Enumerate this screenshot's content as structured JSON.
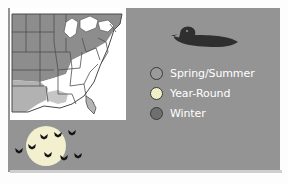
{
  "figure": {
    "type": "range-map-infographic",
    "background_color": "#949494",
    "panel_border_color": "#ffffff"
  },
  "map": {
    "name": "eastern-united-states-range-map",
    "background_color": "#ffffff",
    "state_outline_color": "#4a4a4a",
    "regions": [
      {
        "name": "spring-summer-range",
        "fill": "#8f8f8f"
      },
      {
        "name": "year-round-range",
        "fill": "#ffffff"
      },
      {
        "name": "winter-range",
        "fill": "#b9b9b9"
      }
    ]
  },
  "bird": {
    "name": "duck-silhouette",
    "color": "#2f2f2f"
  },
  "legend": {
    "title": "",
    "items": [
      {
        "label": "Spring/Summer",
        "swatch_color": "#9a9a9a",
        "swatch_border": "#3a3a3a"
      },
      {
        "label": "Year-Round",
        "swatch_color": "#f0efc8",
        "swatch_border": "#3a3a3a"
      },
      {
        "label": "Winter",
        "swatch_color": "#6f6f6f",
        "swatch_border": "#333333"
      }
    ],
    "text_color": "#ffffff"
  },
  "scene": {
    "name": "flying-geese-over-moon",
    "moon_color": "#f2f0cf",
    "geese_color": "#1a1a1a",
    "geese_count": 8
  }
}
